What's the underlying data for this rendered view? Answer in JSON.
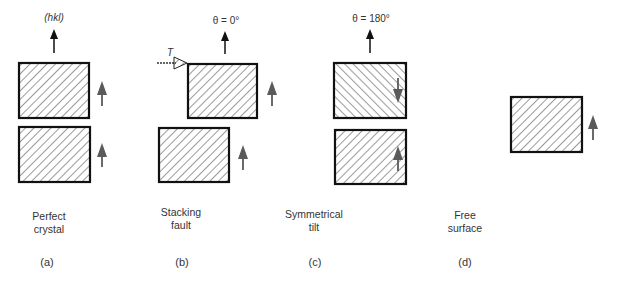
{
  "panels": [
    {
      "id": "a",
      "caption": "(a)",
      "title_line1": "Perfect",
      "title_line2": "crystal",
      "top_label": "(hkl)",
      "blocks": [
        {
          "position": "top",
          "hatch": "backslash",
          "polarity": "up"
        },
        {
          "position": "bottom",
          "hatch": "backslash",
          "polarity": "up"
        }
      ]
    },
    {
      "id": "b",
      "caption": "(b)",
      "title_line1": "Stacking",
      "title_line2": "fault",
      "top_label": "θ = 0°",
      "translation_label": "T",
      "blocks": [
        {
          "position": "top",
          "hatch": "backslash",
          "polarity": "up",
          "shifted": true
        },
        {
          "position": "bottom",
          "hatch": "backslash",
          "polarity": "up"
        }
      ]
    },
    {
      "id": "c",
      "caption": "(c)",
      "title_line1": "Symmetrical",
      "title_line2": "tilt",
      "top_label": "θ = 180°",
      "blocks": [
        {
          "position": "top",
          "hatch": "slash",
          "polarity": "down"
        },
        {
          "position": "bottom",
          "hatch": "backslash",
          "polarity": "up"
        }
      ]
    },
    {
      "id": "d",
      "caption": "(d)",
      "title_line1": "Free",
      "title_line2": "surface",
      "blocks": [
        {
          "position": "single",
          "hatch": "backslash",
          "polarity": "up"
        }
      ]
    }
  ],
  "colors": {
    "outline": "#111111",
    "hatch": "#555555",
    "polarity_arrow": "#5a5a5a",
    "normal_arrow": "#111111"
  }
}
